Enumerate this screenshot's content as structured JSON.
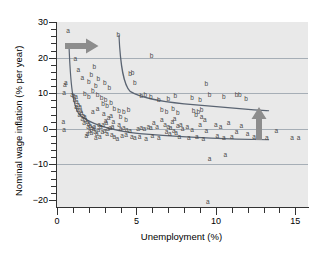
{
  "chart_data": {
    "type": "scatter",
    "title": "",
    "xlabel": "Unemployment (%)",
    "ylabel": "Nominal wage inflation (% per year)",
    "xlim": [
      0,
      15.8
    ],
    "ylim": [
      -22,
      30
    ],
    "xticks": [
      0,
      5,
      10,
      15
    ],
    "yticks": [
      30,
      20,
      10,
      0,
      -10,
      -20
    ],
    "xtick_labels": [
      "0",
      "5",
      "10",
      "15"
    ],
    "ytick_labels": [
      "30",
      "20",
      "10",
      "0",
      "-10",
      "-20"
    ],
    "x_minor_step": 1,
    "y_minor_step": 2,
    "grid": "horizontal",
    "gridlines": [
      20,
      10,
      0,
      -10
    ],
    "legend": "none",
    "series": [
      {
        "name": "a",
        "marker_label": "a",
        "points": [
          [
            0.7,
            27.5
          ],
          [
            0.55,
            13.0
          ],
          [
            0.5,
            12.2
          ],
          [
            0.45,
            10.0
          ],
          [
            0.4,
            1.8
          ],
          [
            0.45,
            -0.4
          ],
          [
            1.35,
            16.5
          ],
          [
            1.6,
            14.2
          ],
          [
            1.15,
            19.5
          ],
          [
            0.95,
            9.6
          ],
          [
            1.05,
            9.2
          ],
          [
            1.2,
            8.8
          ],
          [
            1.1,
            8.0
          ],
          [
            1.25,
            7.4
          ],
          [
            1.35,
            6.8
          ],
          [
            1.2,
            6.2
          ],
          [
            1.45,
            6.0
          ],
          [
            1.3,
            5.4
          ],
          [
            1.5,
            5.0
          ],
          [
            1.55,
            4.4
          ],
          [
            1.4,
            4.0
          ],
          [
            1.65,
            3.6
          ],
          [
            1.75,
            3.2
          ],
          [
            1.6,
            2.8
          ],
          [
            1.8,
            2.4
          ],
          [
            1.9,
            2.0
          ],
          [
            1.7,
            1.6
          ],
          [
            2.0,
            1.3
          ],
          [
            2.1,
            0.9
          ],
          [
            1.95,
            0.5
          ],
          [
            2.2,
            0.2
          ],
          [
            2.3,
            -0.1
          ],
          [
            2.05,
            -0.5
          ],
          [
            2.4,
            -0.8
          ],
          [
            2.15,
            -1.2
          ],
          [
            2.5,
            -1.5
          ],
          [
            1.85,
            -2.0
          ],
          [
            2.6,
            -0.3
          ],
          [
            2.75,
            0.4
          ],
          [
            2.9,
            1.0
          ],
          [
            3.05,
            2.2
          ],
          [
            3.25,
            3.0
          ],
          [
            3.4,
            3.6
          ],
          [
            3.1,
            1.6
          ],
          [
            2.85,
            -1.0
          ],
          [
            3.0,
            -0.6
          ],
          [
            3.2,
            -0.2
          ],
          [
            3.35,
            0.2
          ],
          [
            3.5,
            0.6
          ],
          [
            3.15,
            -1.4
          ],
          [
            3.45,
            -1.8
          ],
          [
            3.6,
            -2.4
          ],
          [
            3.8,
            -3.0
          ],
          [
            2.45,
            -2.6
          ],
          [
            2.7,
            -2.2
          ],
          [
            4.0,
            -0.2
          ],
          [
            4.2,
            0.1
          ],
          [
            4.4,
            -0.3
          ],
          [
            4.6,
            -0.6
          ],
          [
            4.35,
            -1.8
          ],
          [
            4.7,
            -2.2
          ],
          [
            4.9,
            -2.6
          ],
          [
            5.1,
            0.0
          ],
          [
            5.3,
            0.3
          ],
          [
            5.5,
            -0.2
          ],
          [
            5.2,
            -2.4
          ],
          [
            5.6,
            -2.8
          ],
          [
            5.9,
            0.2
          ],
          [
            6.1,
            1.5
          ],
          [
            6.3,
            0.4
          ],
          [
            6.0,
            -2.0
          ],
          [
            6.4,
            -2.5
          ],
          [
            6.6,
            2.4
          ],
          [
            6.8,
            1.2
          ],
          [
            7.0,
            0.6
          ],
          [
            6.9,
            -1.0
          ],
          [
            7.1,
            -1.6
          ],
          [
            7.25,
            2.0
          ],
          [
            7.4,
            2.8
          ],
          [
            7.15,
            0.2
          ],
          [
            7.35,
            -0.5
          ],
          [
            7.5,
            -1.2
          ],
          [
            7.6,
            0.8
          ],
          [
            7.8,
            1.0
          ],
          [
            7.9,
            0.0
          ],
          [
            7.7,
            -2.2
          ],
          [
            8.2,
            0.4
          ],
          [
            8.5,
            -0.4
          ],
          [
            8.3,
            -2.6
          ],
          [
            8.8,
            -2.4
          ],
          [
            9.1,
            3.2
          ],
          [
            9.3,
            2.6
          ],
          [
            9.0,
            1.0
          ],
          [
            9.4,
            -0.6
          ],
          [
            9.2,
            -2.8
          ],
          [
            9.6,
            -8.5
          ],
          [
            9.5,
            -20.5
          ],
          [
            10.0,
            1.2
          ],
          [
            10.3,
            0.6
          ],
          [
            10.1,
            -2.0
          ],
          [
            10.5,
            -2.6
          ],
          [
            10.8,
            1.6
          ],
          [
            10.6,
            -7.5
          ],
          [
            11.0,
            -2.2
          ],
          [
            11.3,
            -1.0
          ],
          [
            11.6,
            0.8
          ],
          [
            12.0,
            -1.4
          ],
          [
            12.4,
            -2.4
          ],
          [
            13.2,
            -2.6
          ],
          [
            13.8,
            -0.6
          ],
          [
            14.8,
            -2.6
          ],
          [
            15.2,
            -2.6
          ],
          [
            2.25,
            4.8
          ],
          [
            2.55,
            5.6
          ],
          [
            2.95,
            4.2
          ],
          [
            3.55,
            2.0
          ],
          [
            3.9,
            1.2
          ],
          [
            4.1,
            -2.0
          ],
          [
            1.9,
            -1.6
          ],
          [
            2.35,
            0.6
          ],
          [
            2.65,
            1.2
          ],
          [
            5.75,
            0.6
          ]
        ]
      },
      {
        "name": "b",
        "marker_label": "b",
        "points": [
          [
            3.85,
            26.5
          ],
          [
            5.95,
            20.5
          ],
          [
            2.35,
            17.5
          ],
          [
            2.15,
            15.0
          ],
          [
            2.6,
            14.0
          ],
          [
            2.0,
            13.2
          ],
          [
            3.0,
            12.8
          ],
          [
            2.45,
            12.0
          ],
          [
            3.3,
            11.6
          ],
          [
            4.6,
            15.5
          ],
          [
            4.75,
            15.8
          ],
          [
            4.9,
            13.0
          ],
          [
            9.4,
            12.5
          ],
          [
            2.25,
            10.5
          ],
          [
            2.55,
            9.4
          ],
          [
            2.8,
            8.6
          ],
          [
            3.05,
            8.0
          ],
          [
            3.4,
            7.2
          ],
          [
            2.0,
            9.0
          ],
          [
            1.75,
            9.8
          ],
          [
            5.3,
            9.2
          ],
          [
            5.55,
            9.6
          ],
          [
            5.9,
            9.0
          ],
          [
            6.4,
            8.0
          ],
          [
            7.0,
            8.4
          ],
          [
            7.45,
            9.2
          ],
          [
            8.5,
            8.6
          ],
          [
            9.0,
            8.2
          ],
          [
            9.6,
            9.4
          ],
          [
            10.5,
            9.0
          ],
          [
            11.3,
            9.5
          ],
          [
            11.5,
            9.4
          ],
          [
            11.9,
            8.4
          ],
          [
            3.6,
            5.6
          ],
          [
            3.9,
            5.0
          ],
          [
            4.2,
            4.6
          ],
          [
            4.5,
            5.2
          ],
          [
            6.6,
            5.4
          ],
          [
            6.9,
            4.8
          ],
          [
            7.3,
            5.6
          ],
          [
            7.6,
            4.4
          ],
          [
            8.6,
            5.0
          ],
          [
            8.9,
            4.6
          ],
          [
            9.1,
            5.2
          ],
          [
            8.75,
            4.0
          ],
          [
            3.15,
            6.4
          ],
          [
            2.9,
            7.0
          ],
          [
            4.0,
            3.2
          ],
          [
            4.35,
            2.6
          ]
        ]
      }
    ],
    "fitted_curves": [
      {
        "name": "lower-phillips-curve",
        "path": "M 0.75,24 C 0.85,12 1.0,6.5 1.4,4.0 C 2.2,0.8 3.6,-0.6 5.2,-1.4 C 7.2,-2.2 9.5,-2.7 11.3,-2.9 C 12.3,-3.0 12.9,-3.05 13.35,-3.1",
        "color": "#5a6472"
      },
      {
        "name": "upper-phillips-curve",
        "path": "M 3.9,26.3 C 4.0,17 4.2,12.5 4.6,10.5 C 5.3,8.6 6.6,7.6 8.0,7.0 C 9.6,6.4 11.2,5.7 12.4,5.3 C 12.9,5.15 13.1,5.1 13.35,5.05",
        "color": "#5a6472"
      }
    ],
    "annotations": [
      {
        "name": "shift-right-arrow",
        "type": "arrow",
        "direction": "right",
        "x": 1.6,
        "y": 23.3,
        "color": "#8d8d8d"
      },
      {
        "name": "shift-up-arrow",
        "type": "arrow",
        "direction": "up",
        "x": 12.7,
        "y": 1.6,
        "color": "#8d8d8d"
      }
    ],
    "colors": {
      "plot_background": "#e9e9e9",
      "grid": "#9aa3ad",
      "axis": "#333333",
      "marker": "#4a4a4a",
      "curve": "#5a6472",
      "arrow": "#8d8d8d"
    }
  }
}
